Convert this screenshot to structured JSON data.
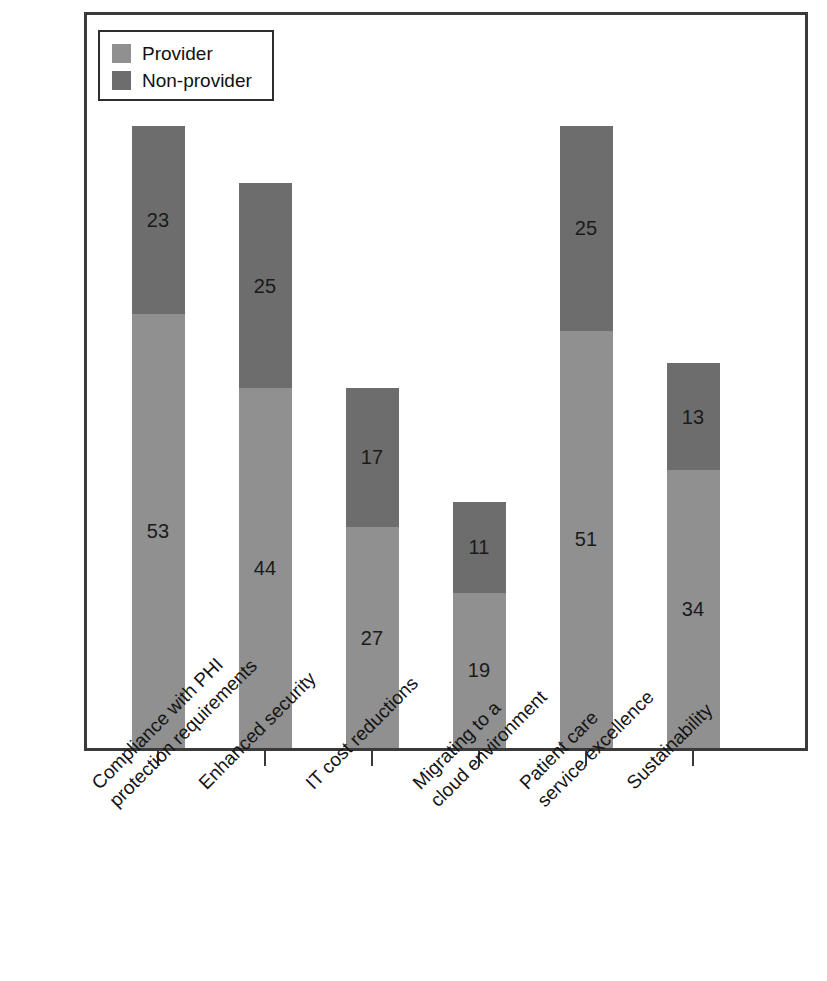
{
  "chart_data": {
    "type": "bar",
    "subtype": "stacked-vertical",
    "title": "",
    "xlabel": "",
    "ylabel": "",
    "grid": false,
    "axis": {
      "visible_ticks": true,
      "y_axis_labels": false,
      "ylim": [
        0,
        76
      ]
    },
    "legend": {
      "position": "top-left-inside",
      "entries": [
        {
          "name": "Provider",
          "color": "#909090"
        },
        {
          "name": "Non-provider",
          "color": "#6d6d6d"
        }
      ]
    },
    "categories": [
      {
        "line1": "Compliance with PHI",
        "line2": "protection requirements"
      },
      {
        "line1": "Enhanced security",
        "line2": ""
      },
      {
        "line1": "IT cost reductions",
        "line2": ""
      },
      {
        "line1": "Migrating to a",
        "line2": "cloud environment"
      },
      {
        "line1": "Patient care",
        "line2": "service excellence"
      },
      {
        "line1": "Sustainability",
        "line2": ""
      }
    ],
    "series": [
      {
        "name": "Provider",
        "color": "#909090",
        "values": [
          53,
          44,
          27,
          19,
          51,
          34
        ]
      },
      {
        "name": "Non-provider",
        "color": "#6d6d6d",
        "values": [
          23,
          25,
          17,
          11,
          25,
          13
        ]
      }
    ],
    "totals": [
      76,
      69,
      44,
      30,
      76,
      47
    ]
  },
  "colors": {
    "provider": "#909090",
    "non_provider": "#6d6d6d",
    "frame": "#3a3a3a",
    "text": "#141414",
    "background": "#ffffff"
  }
}
